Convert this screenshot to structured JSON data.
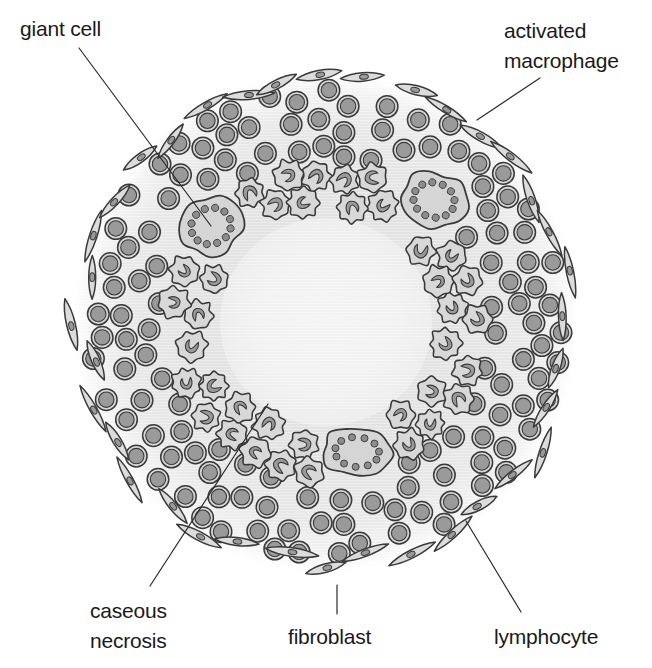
{
  "figure": {
    "width": 652,
    "height": 668,
    "background": "#ffffff"
  },
  "labels": [
    {
      "id": "giant-cell",
      "text": "giant cell",
      "lines": [
        "giant cell"
      ],
      "x": 20,
      "y": 14,
      "align": "left",
      "leader": {
        "x1": 79,
        "y1": 48,
        "x2": 211,
        "y2": 226
      }
    },
    {
      "id": "activated-macrophage",
      "text": "activated macrophage",
      "lines": [
        "activated",
        "macrophage"
      ],
      "x": 504,
      "y": 16,
      "align": "left",
      "leader": {
        "x1": 540,
        "y1": 78,
        "x2": 477,
        "y2": 120
      }
    },
    {
      "id": "caseous-necrosis",
      "text": "caseous necrosis",
      "lines": [
        "caseous",
        "necrosis"
      ],
      "x": 90,
      "y": 596,
      "align": "left",
      "leader": {
        "x1": 150,
        "y1": 586,
        "x2": 268,
        "y2": 404
      }
    },
    {
      "id": "fibroblast",
      "text": "fibroblast",
      "lines": [
        "fibroblast"
      ],
      "x": 288,
      "y": 622,
      "align": "left",
      "leader": {
        "x1": 337,
        "y1": 614,
        "x2": 337,
        "y2": 585
      }
    },
    {
      "id": "lymphocyte",
      "text": "lymphocyte",
      "lines": [
        "lymphocyte"
      ],
      "x": 494,
      "y": 622,
      "align": "left",
      "leader": {
        "x1": 521,
        "y1": 612,
        "x2": 466,
        "y2": 521
      }
    }
  ],
  "colors": {
    "ink": "#2b2b2b",
    "text": "#1a1a1a",
    "halo": "#e3e3e3",
    "halo_edge": "#f4f4f4",
    "caseous_fill": "#efefef",
    "cell_outline": "#3a3a3a",
    "cytoplasm": "#d8d8d8",
    "nucleus": "#9a9a9a",
    "nucleus_dark": "#8c8c8c",
    "giant_fill": "#d5d5d5",
    "fibroblast_fill": "#dcdcdc",
    "background": "#ffffff"
  },
  "geometry": {
    "center_x": 326,
    "center_y": 322,
    "halo_radius": 252,
    "caseous_radius": 106,
    "macrophage_ring_inner": 108,
    "macrophage_ring_outer": 162,
    "lymphocyte_ring_inner": 164,
    "lymphocyte_ring_outer": 236,
    "fibroblast_ring_radius": 246
  },
  "zones": [
    {
      "name": "caseous necrosis",
      "role": "central necrotic core",
      "radius": 106
    },
    {
      "name": "activated macrophage",
      "role": "epithelioid macrophage collar",
      "inner": 108,
      "outer": 162
    },
    {
      "name": "lymphocyte",
      "role": "lymphocyte cuff",
      "inner": 164,
      "outer": 236
    },
    {
      "name": "fibroblast",
      "role": "peripheral fibroblast rim",
      "radius": 246
    }
  ],
  "giant_cells": [
    {
      "cx": 211,
      "cy": 226,
      "rx": 32,
      "ry": 29,
      "nuclei": 12,
      "rotation": -20
    },
    {
      "cx": 434,
      "cy": 200,
      "rx": 33,
      "ry": 28,
      "nuclei": 12,
      "rotation": 15
    },
    {
      "cx": 357,
      "cy": 452,
      "rx": 35,
      "ry": 24,
      "nuclei": 11,
      "rotation": 4
    }
  ],
  "cell_counts": {
    "macrophages": 96,
    "lymphocytes": 180,
    "fibroblasts": 36,
    "giant_cells": 3
  },
  "legend_order": [
    "giant cell",
    "activated macrophage",
    "caseous necrosis",
    "fibroblast",
    "lymphocyte"
  ]
}
